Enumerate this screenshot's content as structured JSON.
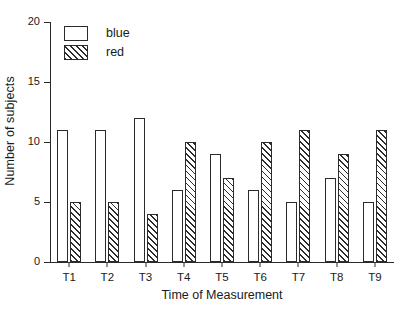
{
  "chart_data": {
    "type": "bar",
    "title": "",
    "subtitle": "",
    "xlabel": "Time of Measurement",
    "ylabel": "Number of subjects",
    "categories": [
      "T1",
      "T2",
      "T3",
      "T4",
      "T5",
      "T6",
      "T7",
      "T8",
      "T9"
    ],
    "series": [
      {
        "name": "blue",
        "values": [
          11,
          11,
          12,
          6,
          9,
          6,
          5,
          7,
          5
        ]
      },
      {
        "name": "red",
        "values": [
          5,
          5,
          4,
          10,
          7,
          10,
          11,
          9,
          11
        ]
      }
    ],
    "ylim": [
      0,
      20
    ],
    "yticks": [
      0,
      5,
      10,
      15,
      20
    ],
    "ytick_labels": [
      "0",
      "5",
      "10",
      "15",
      "20"
    ],
    "grid": false,
    "legend_position": "top-left",
    "legend": [
      "blue",
      "red"
    ]
  },
  "style": {
    "axis_color": "#2b2b2b",
    "background": "#ffffff",
    "series_fills": [
      "#ffffff",
      "#ffffff"
    ],
    "series_patterns": [
      "solid",
      "diagonal-hatch"
    ]
  }
}
